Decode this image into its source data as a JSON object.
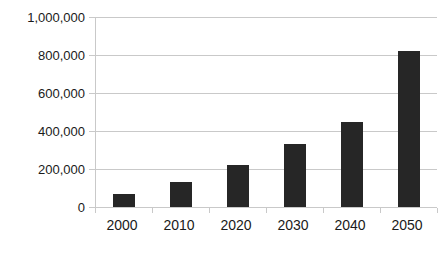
{
  "chart_data": {
    "type": "bar",
    "title": "",
    "subtitle": "",
    "xlabel": "",
    "ylabel": "",
    "categories": [
      "2000",
      "2010",
      "2020",
      "2030",
      "2040",
      "2050"
    ],
    "values": [
      70000,
      130000,
      220000,
      330000,
      450000,
      820000
    ],
    "series": [
      {
        "name": "",
        "values": [
          70000,
          130000,
          220000,
          330000,
          450000,
          820000
        ]
      }
    ],
    "ylim": [
      0,
      1000000
    ],
    "ytick_values": [
      0,
      200000,
      400000,
      600000,
      800000,
      1000000
    ],
    "ytick_labels": [
      "0",
      "200,000",
      "400,000",
      "600,000",
      "800,000",
      "1,000,000"
    ],
    "xtick_labels": [
      "2000",
      "2010",
      "2020",
      "2030",
      "2040",
      "2050"
    ],
    "grid": true,
    "grid_axis": "y",
    "legend": false,
    "legend_position": "none",
    "bar_color": "#262626",
    "grid_color": "#c9c9c9",
    "axis_color": "#c9c9c9",
    "text_color": "#1a1a1a",
    "background": "#ffffff",
    "annotations": []
  },
  "axes": {
    "y_labels": [
      {
        "text": "1,000,000",
        "value": 1000000
      },
      {
        "text": "800,000",
        "value": 800000
      },
      {
        "text": "600,000",
        "value": 600000
      },
      {
        "text": "400,000",
        "value": 400000
      },
      {
        "text": "200,000",
        "value": 200000
      },
      {
        "text": "0",
        "value": 0
      }
    ],
    "x_labels": [
      {
        "text": "2000"
      },
      {
        "text": "2010"
      },
      {
        "text": "2020"
      },
      {
        "text": "2030"
      },
      {
        "text": "2040"
      },
      {
        "text": "2050"
      }
    ]
  },
  "title_clip": {
    "text": ""
  }
}
